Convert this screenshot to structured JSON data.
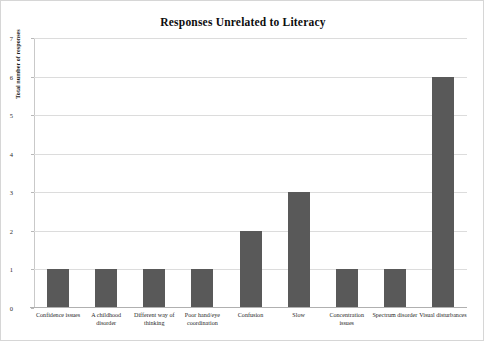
{
  "chart_data": {
    "type": "bar",
    "title": "Responses Unrelated to Literacy",
    "xlabel": "",
    "ylabel": "Total number of responses",
    "ylim": [
      0,
      7
    ],
    "ytick_labels": [
      "0",
      "1",
      "2",
      "3",
      "4",
      "5",
      "6",
      "7"
    ],
    "yticks": [
      0,
      1,
      2,
      3,
      4,
      5,
      6,
      7
    ],
    "grid": true,
    "legend": "none",
    "bar_color": "#595959",
    "gridline_color": "#dcdcdc",
    "categories": [
      "Confidence issues",
      "A childhood disorder",
      "Different way of thinking",
      "Poor hand/eye coordination",
      "Confusion",
      "Slow",
      "Concentration issues",
      "Spectrum disorder",
      "Visual disturbances"
    ],
    "values": [
      1,
      1,
      1,
      1,
      2,
      3,
      1,
      1,
      6
    ]
  }
}
